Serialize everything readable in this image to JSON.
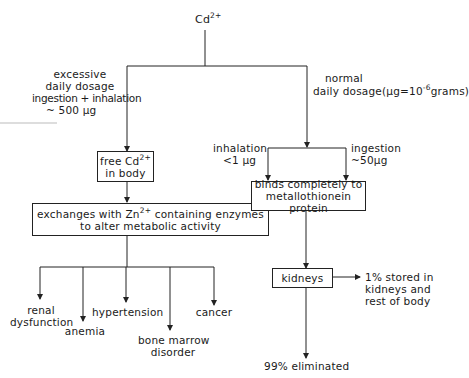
{
  "root": {
    "base": "Cd",
    "charge": "2+"
  },
  "left_branch": {
    "label_lines": [
      "excessive",
      "daily dosage",
      "ingestion + inhalation",
      "~ 500 μg"
    ],
    "free_box": {
      "line1_base": "free Cd",
      "line1_charge": "2+",
      "line2": "in body"
    },
    "exchange_box": {
      "line1_pre": "exchanges with Zn",
      "line1_charge": "2+",
      "line1_post": " containing enzymes",
      "line2": "to alter metabolic activity"
    },
    "effects": [
      {
        "lines": [
          "renal",
          "dysfunction"
        ]
      },
      {
        "lines": [
          "anemia"
        ]
      },
      {
        "lines": [
          "hypertension"
        ]
      },
      {
        "lines": [
          "bone marrow",
          "disorder"
        ]
      },
      {
        "lines": [
          "cancer"
        ]
      }
    ]
  },
  "right_branch": {
    "label_line1": "normal",
    "label_line2_pre": "daily dosage(μg=10",
    "label_line2_exp": "-6",
    "label_line2_post": "grams)",
    "inhalation": {
      "line1": "inhalation",
      "line2": "<1 μg"
    },
    "ingestion": {
      "line1": "ingestion",
      "line2": "~50μg"
    },
    "binds_box": {
      "line1": "binds completely to",
      "line2": "metallothionein protein"
    },
    "kidneys_box": {
      "label": "kidneys"
    },
    "stored": {
      "lines": [
        "1% stored in",
        "kidneys and",
        "rest of body"
      ]
    },
    "eliminated": "99% eliminated"
  },
  "colors": {
    "line": "#222222",
    "text": "#1a1a1a",
    "background": "#ffffff"
  }
}
